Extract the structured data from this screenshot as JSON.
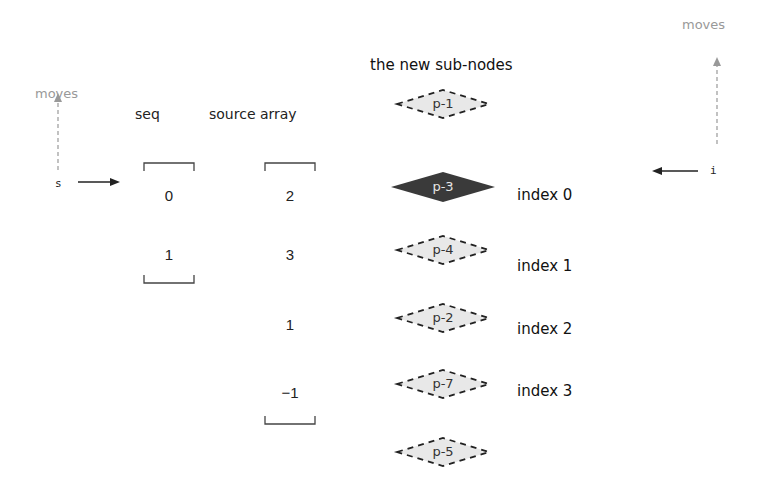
{
  "left": {
    "moves_label": "moves",
    "pointer_label": "s"
  },
  "right": {
    "moves_label": "moves",
    "pointer_label": "i"
  },
  "columns": {
    "seq": {
      "header": "seq",
      "values": [
        "0",
        "1"
      ]
    },
    "source": {
      "header": "source array",
      "values": [
        "2",
        "3",
        "1",
        "−1"
      ]
    }
  },
  "nodes": {
    "title": "the new sub-nodes",
    "items": [
      {
        "label": "p-1",
        "style": "dashed",
        "index_label": ""
      },
      {
        "label": "p-3",
        "style": "solid",
        "index_label": "index 0"
      },
      {
        "label": "p-4",
        "style": "dashed",
        "index_label": "index 1"
      },
      {
        "label": "p-2",
        "style": "dashed",
        "index_label": "index 2"
      },
      {
        "label": "p-7",
        "style": "dashed",
        "index_label": "index 3"
      },
      {
        "label": "p-5",
        "style": "dashed",
        "index_label": ""
      }
    ]
  },
  "colors": {
    "solid_node_fill": "#3a3a3a",
    "dashed_node_fill": "#e8e8e8",
    "muted_text": "#999999"
  }
}
